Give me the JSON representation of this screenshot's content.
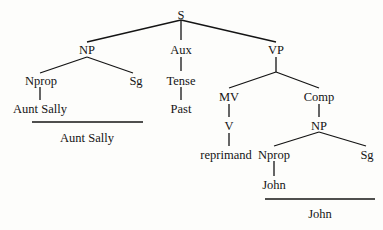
{
  "tree": {
    "root": "S",
    "nodes": {
      "S": "S",
      "NP_subj": "NP",
      "Aux": "Aux",
      "VP": "VP",
      "Nprop_subj": "Nprop",
      "Sg_subj": "Sg",
      "Tense": "Tense",
      "AuntSally_leaf": "Aunt Sally",
      "Past": "Past",
      "MV": "MV",
      "Comp": "Comp",
      "V": "V",
      "NP_obj": "NP",
      "reprimand": "reprimand",
      "Nprop_obj": "Nprop",
      "Sg_obj": "Sg",
      "John_leaf": "John"
    },
    "underline_labels": {
      "subject": "Aunt Sally",
      "object": "John"
    }
  }
}
